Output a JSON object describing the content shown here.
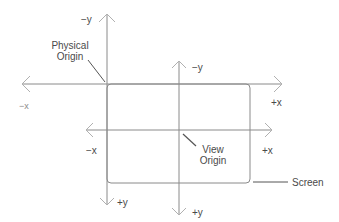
{
  "diagram": {
    "title": "",
    "colors": {
      "line": "#8a8a8a",
      "arrow": "#b0b0b0",
      "text": "#4a4a4a",
      "background": "#ffffff"
    },
    "physical_axes": {
      "neg_y": "−y",
      "pos_y": "+y",
      "neg_x": "−x",
      "pos_x": "+x"
    },
    "view_axes": {
      "neg_y": "−y",
      "pos_y": "+y",
      "neg_x": "−x",
      "pos_x": "+x"
    },
    "labels": {
      "physical_origin_line1": "Physical",
      "physical_origin_line2": "Origin",
      "view_origin_line1": "View",
      "view_origin_line2": "Origin",
      "screen": "Screen"
    }
  }
}
